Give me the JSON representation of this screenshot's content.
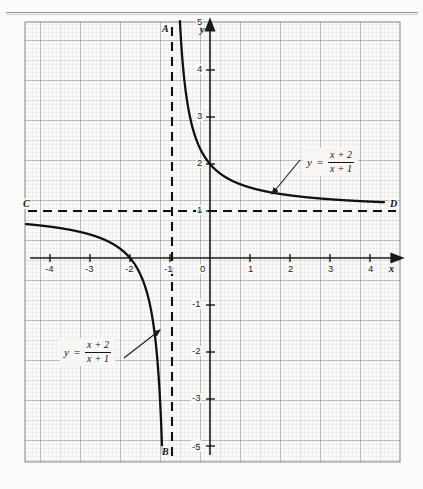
{
  "figure": {
    "type": "graph",
    "plot_area": {
      "x_min": -5.2,
      "x_max": 5.0,
      "y_min": -5.9,
      "y_max": 6.1
    }
  },
  "axes": {
    "x_axis_label": "x",
    "y_axis_label": "y",
    "x_ticks": [
      "-4",
      "-3",
      "-2",
      "-1",
      "0",
      "1",
      "2",
      "3",
      "4"
    ],
    "y_ticks_positive": [
      "1",
      "2",
      "3",
      "4",
      "5"
    ],
    "y_ticks_negative": [
      "-1",
      "-2",
      "-3",
      "-4",
      "-5"
    ]
  },
  "annotations": {
    "asymptote_vertical_top": "A",
    "asymptote_vertical_bottom": "B",
    "asymptote_horizontal_left": "C",
    "asymptote_horizontal_right": "D"
  },
  "equation": {
    "lhs": "y",
    "equals": "=",
    "numerator": "x + 2",
    "denominator": "x + 1"
  },
  "colors": {
    "curve": "#111111",
    "axis": "#1a1a1a",
    "grid_fine": "#d8d8d8",
    "grid_mid": "#bdbdbd",
    "grid_major": "#8c8c8c",
    "asymptote": "#111111",
    "page_background": "#fcfbfa"
  },
  "chart_data": {
    "type": "line",
    "title": "",
    "xlabel": "x",
    "ylabel": "y",
    "xlim": [
      -5.2,
      5.0
    ],
    "ylim": [
      -5.9,
      6.1
    ],
    "grid": true,
    "legend": "none",
    "function": "y = (x + 2) / (x + 1)",
    "asymptotes": [
      {
        "name": "AB",
        "type": "vertical",
        "value": -1,
        "style": "dashed",
        "endpoints": [
          "A",
          "B"
        ]
      },
      {
        "name": "CD",
        "type": "horizontal",
        "value": 1,
        "style": "dashed",
        "endpoints": [
          "C",
          "D"
        ]
      }
    ],
    "series": [
      {
        "name": "left-branch",
        "x": [
          -5.2,
          -5.0,
          -4.5,
          -4.0,
          -3.5,
          -3.0,
          -2.6,
          -2.3,
          -2.0,
          -1.8,
          -1.6,
          -1.45,
          -1.35,
          -1.28,
          -1.22,
          -1.18,
          -1.15
        ],
        "y": [
          0.762,
          0.75,
          0.714,
          0.667,
          0.6,
          0.5,
          0.375,
          0.231,
          0.0,
          -0.25,
          -0.667,
          -1.111,
          -1.857,
          -2.571,
          -3.636,
          -4.556,
          -5.667
        ]
      },
      {
        "name": "right-branch",
        "x": [
          -0.82,
          -0.8,
          -0.75,
          -0.7,
          -0.6,
          -0.5,
          -0.35,
          -0.2,
          0.0,
          0.25,
          0.5,
          1.0,
          1.5,
          2.0,
          2.5,
          3.0,
          3.5,
          4.0,
          4.3
        ],
        "y": [
          6.556,
          6.0,
          5.0,
          4.333,
          3.5,
          3.0,
          2.538,
          2.25,
          2.0,
          1.8,
          1.667,
          1.5,
          1.4,
          1.333,
          1.286,
          1.25,
          1.222,
          1.2,
          1.189
        ]
      }
    ],
    "key_points": [
      {
        "x": -2,
        "y": 0,
        "note": "x-intercept"
      },
      {
        "x": 0,
        "y": 2,
        "note": "y-intercept"
      }
    ]
  }
}
